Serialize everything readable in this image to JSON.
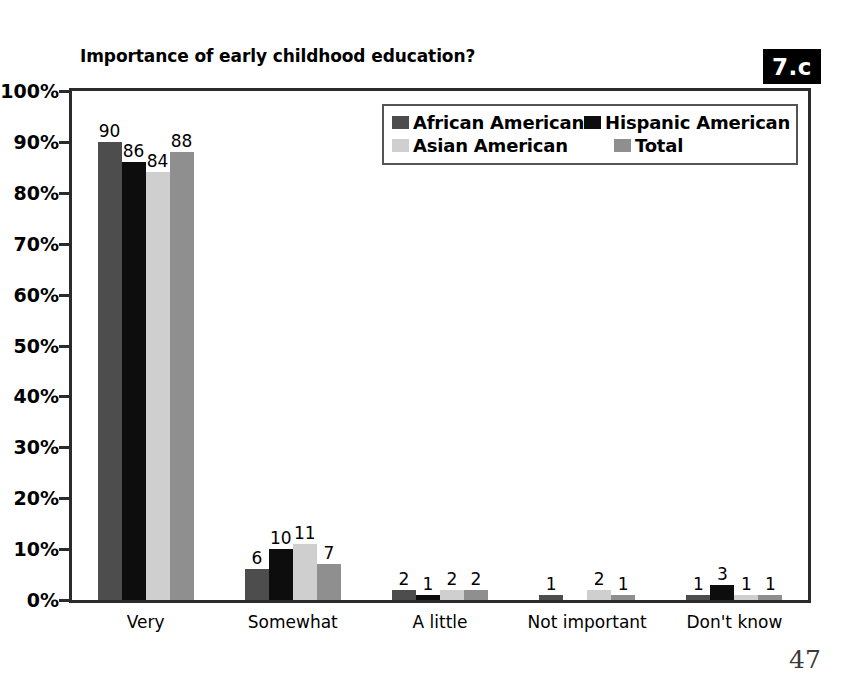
{
  "figure_badge": "7.c",
  "page_number": "47",
  "chart_data": {
    "type": "bar",
    "title": "Importance of early childhood education?",
    "xlabel": "",
    "ylabel": "",
    "ylim": [
      0,
      100
    ],
    "ytick_labels": [
      "0%",
      "10%",
      "20%",
      "30%",
      "40%",
      "50%",
      "60%",
      "70%",
      "80%",
      "90%",
      "100%"
    ],
    "ytick_values": [
      0,
      10,
      20,
      30,
      40,
      50,
      60,
      70,
      80,
      90,
      100
    ],
    "grid": false,
    "legend_position": "top-right-inside",
    "categories": [
      "Very",
      "Somewhat",
      "A little",
      "Not important",
      "Don't know"
    ],
    "series": [
      {
        "name": "African American",
        "color": "#4d4d4d",
        "values": [
          90,
          6,
          2,
          1,
          1
        ],
        "labels": [
          "90",
          "6",
          "2",
          "1",
          "1"
        ]
      },
      {
        "name": "Hispanic American",
        "color": "#0d0d0d",
        "values": [
          86,
          10,
          1,
          0,
          3
        ],
        "labels": [
          "86",
          "10",
          "1",
          "",
          "3"
        ]
      },
      {
        "name": "Asian American",
        "color": "#cfcfcf",
        "values": [
          84,
          11,
          2,
          2,
          1
        ],
        "labels": [
          "84",
          "11",
          "2",
          "2",
          "1"
        ]
      },
      {
        "name": "Total",
        "color": "#8f8f8f",
        "values": [
          88,
          7,
          2,
          1,
          1
        ],
        "labels": [
          "88",
          "7",
          "2",
          "1",
          "1"
        ]
      }
    ]
  }
}
